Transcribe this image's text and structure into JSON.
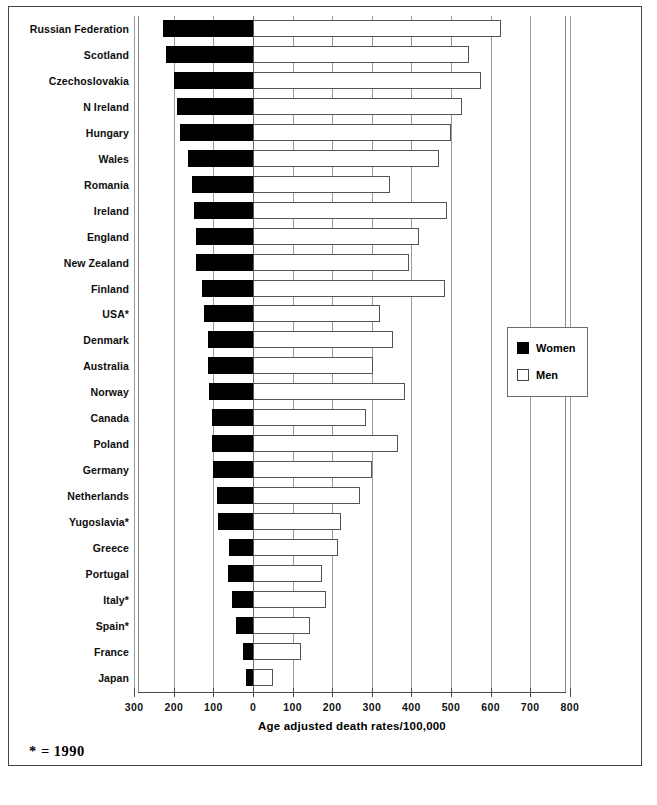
{
  "figure": {
    "footnote": "* = 1990",
    "xlabel": "Age adjusted death rates/100,000"
  },
  "legend": {
    "title": "",
    "entries": [
      {
        "label": "Women",
        "color": "#000000",
        "swatch": "filled-black-square"
      },
      {
        "label": "Men",
        "color": "#ffffff",
        "swatch": "hollow-white-square"
      }
    ]
  },
  "chart_data": {
    "type": "bar",
    "orientation": "horizontal-bidirectional",
    "title": "",
    "xlabel": "Age adjusted death rates/100,000",
    "ylabel": "",
    "grid": true,
    "legend_position": "right-middle",
    "xlim": [
      -300,
      800
    ],
    "xticks": [
      300,
      200,
      100,
      0,
      100,
      200,
      300,
      400,
      500,
      600,
      700,
      800
    ],
    "xtick_labels": [
      "300",
      "200",
      "100",
      "0",
      "100",
      "200",
      "300",
      "400",
      "500",
      "600",
      "700",
      "800"
    ],
    "note": "Women plotted leftward from zero, Men plotted rightward from zero",
    "categories": [
      "Russian Federation",
      "Scotland",
      "Czechoslovakia",
      "N Ireland",
      "Hungary",
      "Wales",
      "Romania",
      "Ireland",
      "England",
      "New Zealand",
      "Finland",
      "USA*",
      "Denmark",
      "Australia",
      "Norway",
      "Canada",
      "Poland",
      "Germany",
      "Netherlands",
      "Yugoslavia*",
      "Greece",
      "Portugal",
      "Italy*",
      "Spain*",
      "France",
      "Japan"
    ],
    "series": [
      {
        "name": "Women",
        "values": [
          228,
          220,
          200,
          193,
          185,
          165,
          155,
          150,
          143,
          143,
          130,
          123,
          113,
          113,
          110,
          103,
          103,
          100,
          90,
          88,
          60,
          63,
          53,
          43,
          25,
          18
        ]
      },
      {
        "name": "Men",
        "values": [
          625,
          545,
          575,
          528,
          500,
          470,
          345,
          490,
          420,
          395,
          485,
          320,
          353,
          303,
          383,
          285,
          365,
          300,
          270,
          223,
          215,
          173,
          185,
          145,
          120,
          50
        ]
      }
    ]
  }
}
